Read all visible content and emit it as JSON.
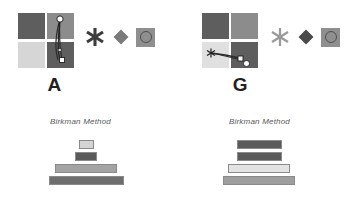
{
  "figure": {
    "background": "#ffffff",
    "width": 346,
    "height": 206
  },
  "panels": [
    {
      "id": "panel-a",
      "letter": "A",
      "method_label": "Birkman Method",
      "quadrants": [
        {
          "position": "top-left",
          "color": "#5e5e5e"
        },
        {
          "position": "top-right",
          "color": "#8c8c8c"
        },
        {
          "position": "bottom-left",
          "color": "#d6d6d6"
        },
        {
          "position": "bottom-right",
          "color": "#5e5e5e"
        }
      ],
      "trajectory": {
        "start_marker": "circle",
        "start_marker_color": "#ffffff",
        "end_marker": "square",
        "end_marker_color": "#ffffff",
        "line_color": "#2b2b2b",
        "orientation": "vertical"
      },
      "shapes": [
        {
          "name": "asterisk-shape",
          "glyph": "✱",
          "color": "#3d3d3d",
          "size": 22
        },
        {
          "name": "diamond-shape",
          "color": "#7a7a7a",
          "size": 15
        },
        {
          "name": "square-ring-shape",
          "square_color": "#8f8f8f",
          "ring_color": "#4f4f4f"
        }
      ],
      "chart_data": {
        "type": "bar",
        "title": "Birkman Method",
        "orientation": "horizontal-stack",
        "categories": [
          "bar-1",
          "bar-2",
          "bar-3",
          "bar-4"
        ],
        "values": [
          15,
          22,
          62,
          75
        ],
        "colors": [
          "#d4d4d4",
          "#5a5a5a",
          "#a3a3a3",
          "#6e6e6e"
        ],
        "xlabel": "",
        "ylabel": "",
        "grid": false,
        "legend": "none"
      }
    },
    {
      "id": "panel-g",
      "letter": "G",
      "method_label": "Birkman Method",
      "quadrants": [
        {
          "position": "top-left",
          "color": "#5e5e5e"
        },
        {
          "position": "top-right",
          "color": "#8c8c8c"
        },
        {
          "position": "bottom-left",
          "color": "#e0e0e0"
        },
        {
          "position": "bottom-right",
          "color": "#5e5e5e"
        }
      ],
      "trajectory": {
        "start_marker": "starburst",
        "start_marker_color": "#2b2b2b",
        "end_marker": "square",
        "end_marker_color": "#ffffff",
        "extra_marker": "circle",
        "extra_marker_color": "#ffffff",
        "line_color": "#2b2b2b",
        "orientation": "horizontal"
      },
      "shapes": [
        {
          "name": "asterisk-shape",
          "glyph": "✱",
          "color": "#9a9a9a",
          "size": 22
        },
        {
          "name": "diamond-shape",
          "color": "#4a4a4a",
          "size": 15
        },
        {
          "name": "square-ring-shape",
          "square_color": "#8f8f8f",
          "ring_color": "#4f4f4f"
        }
      ],
      "chart_data": {
        "type": "bar",
        "title": "Birkman Method",
        "orientation": "horizontal-stack",
        "categories": [
          "bar-1",
          "bar-2",
          "bar-3",
          "bar-4"
        ],
        "values": [
          45,
          45,
          62,
          72
        ],
        "colors": [
          "#5a5a5a",
          "#5a5a5a",
          "#e3e3e3",
          "#9e9e9e"
        ],
        "xlabel": "",
        "ylabel": "",
        "grid": false,
        "legend": "none"
      }
    }
  ]
}
